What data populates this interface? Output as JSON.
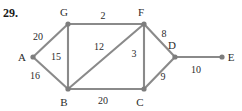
{
  "problem": {
    "number": "29."
  },
  "graph": {
    "type": "weighted-undirected-graph",
    "nodes": [
      {
        "id": "A",
        "label": "A",
        "x": 33,
        "y": 57,
        "label_x": 22,
        "label_y": 61
      },
      {
        "id": "B",
        "label": "B",
        "x": 68,
        "y": 89,
        "label_x": 64,
        "label_y": 106
      },
      {
        "id": "C",
        "label": "C",
        "x": 144,
        "y": 89,
        "label_x": 140,
        "label_y": 106
      },
      {
        "id": "D",
        "label": "D",
        "x": 175,
        "y": 57,
        "label_x": 172,
        "label_y": 49
      },
      {
        "id": "E",
        "label": "E",
        "x": 222,
        "y": 57,
        "label_x": 231,
        "label_y": 61
      },
      {
        "id": "F",
        "label": "F",
        "x": 144,
        "y": 24,
        "label_x": 141,
        "label_y": 16
      },
      {
        "id": "G",
        "label": "G",
        "x": 68,
        "y": 24,
        "label_x": 64,
        "label_y": 16
      }
    ],
    "edges": [
      {
        "from": "A",
        "to": "G",
        "weight": "20",
        "label_x": 38,
        "label_y": 40
      },
      {
        "from": "A",
        "to": "B",
        "weight": "16",
        "label_x": 35,
        "label_y": 79
      },
      {
        "from": "G",
        "to": "F",
        "weight": "2",
        "label_x": 103,
        "label_y": 19
      },
      {
        "from": "G",
        "to": "B",
        "weight": "15",
        "label_x": 56,
        "label_y": 60
      },
      {
        "from": "B",
        "to": "F",
        "weight": "12",
        "label_x": 99,
        "label_y": 50
      },
      {
        "from": "B",
        "to": "C",
        "weight": "20",
        "label_x": 103,
        "label_y": 104
      },
      {
        "from": "F",
        "to": "C",
        "weight": "3",
        "label_x": 134,
        "label_y": 57
      },
      {
        "from": "F",
        "to": "D",
        "weight": "8",
        "label_x": 164,
        "label_y": 37
      },
      {
        "from": "C",
        "to": "D",
        "weight": "9",
        "label_x": 163,
        "label_y": 80
      },
      {
        "from": "D",
        "to": "E",
        "weight": "10",
        "label_x": 196,
        "label_y": 73
      }
    ],
    "colors": {
      "edge": "#8a8a8a",
      "node": "#7d7d7d",
      "text": "#2b2b2b",
      "background": "#ffffff"
    }
  }
}
